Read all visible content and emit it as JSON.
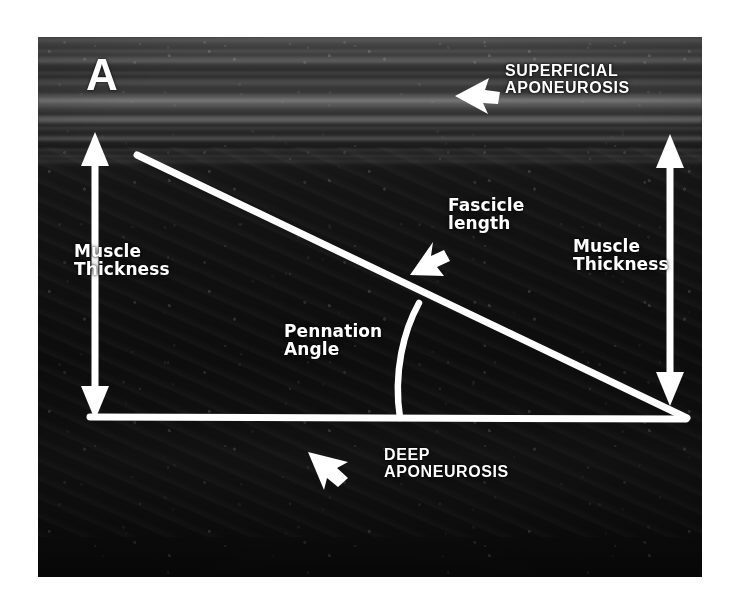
{
  "figure": {
    "panel_label": "A",
    "modality": "b-mode-ultrasound"
  },
  "colors": {
    "annotation": "#ffffff",
    "page_background": "#ffffff",
    "image_background": "#0d0d0d",
    "aponeurosis_band": "#e6e6e6"
  },
  "annotations": {
    "panel_letter": "A",
    "superficial_aponeurosis": "SUPERFICIAL\nAPONEUROSIS",
    "fascicle_length": "Fascicle\nlength",
    "muscle_thickness_left": "Muscle\nThickness",
    "muscle_thickness_right": "Muscle\nThickness",
    "pennation_angle": "Pennation\nAngle",
    "deep_aponeurosis": "DEEP\nAPONEUROSIS"
  },
  "overlay_geometry": {
    "fascicle_line": {
      "x1": 137,
      "y1": 155,
      "x2": 686,
      "y2": 418
    },
    "deep_aponeurosis_line": {
      "x1": 90,
      "y1": 418,
      "x2": 686,
      "y2": 418
    },
    "pennation_arc": {
      "start_x": 419,
      "start_y": 305,
      "end_x": 400,
      "end_y": 418
    },
    "thickness_arrow_left": {
      "x": 95,
      "y_top": 136,
      "y_bottom": 415
    },
    "thickness_arrow_right": {
      "x": 670,
      "y_top": 136,
      "y_bottom": 404
    },
    "superficial_arrow": {
      "tip_x": 456,
      "tip_y": 95,
      "direction": "left"
    },
    "fascicle_arrow": {
      "tip_x": 412,
      "tip_y": 272,
      "direction": "down-left"
    },
    "deep_arrow": {
      "tip_x": 310,
      "tip_y": 452,
      "direction": "up-left"
    },
    "image_rect": {
      "left": 38,
      "top": 37,
      "width": 664,
      "height": 540
    }
  }
}
